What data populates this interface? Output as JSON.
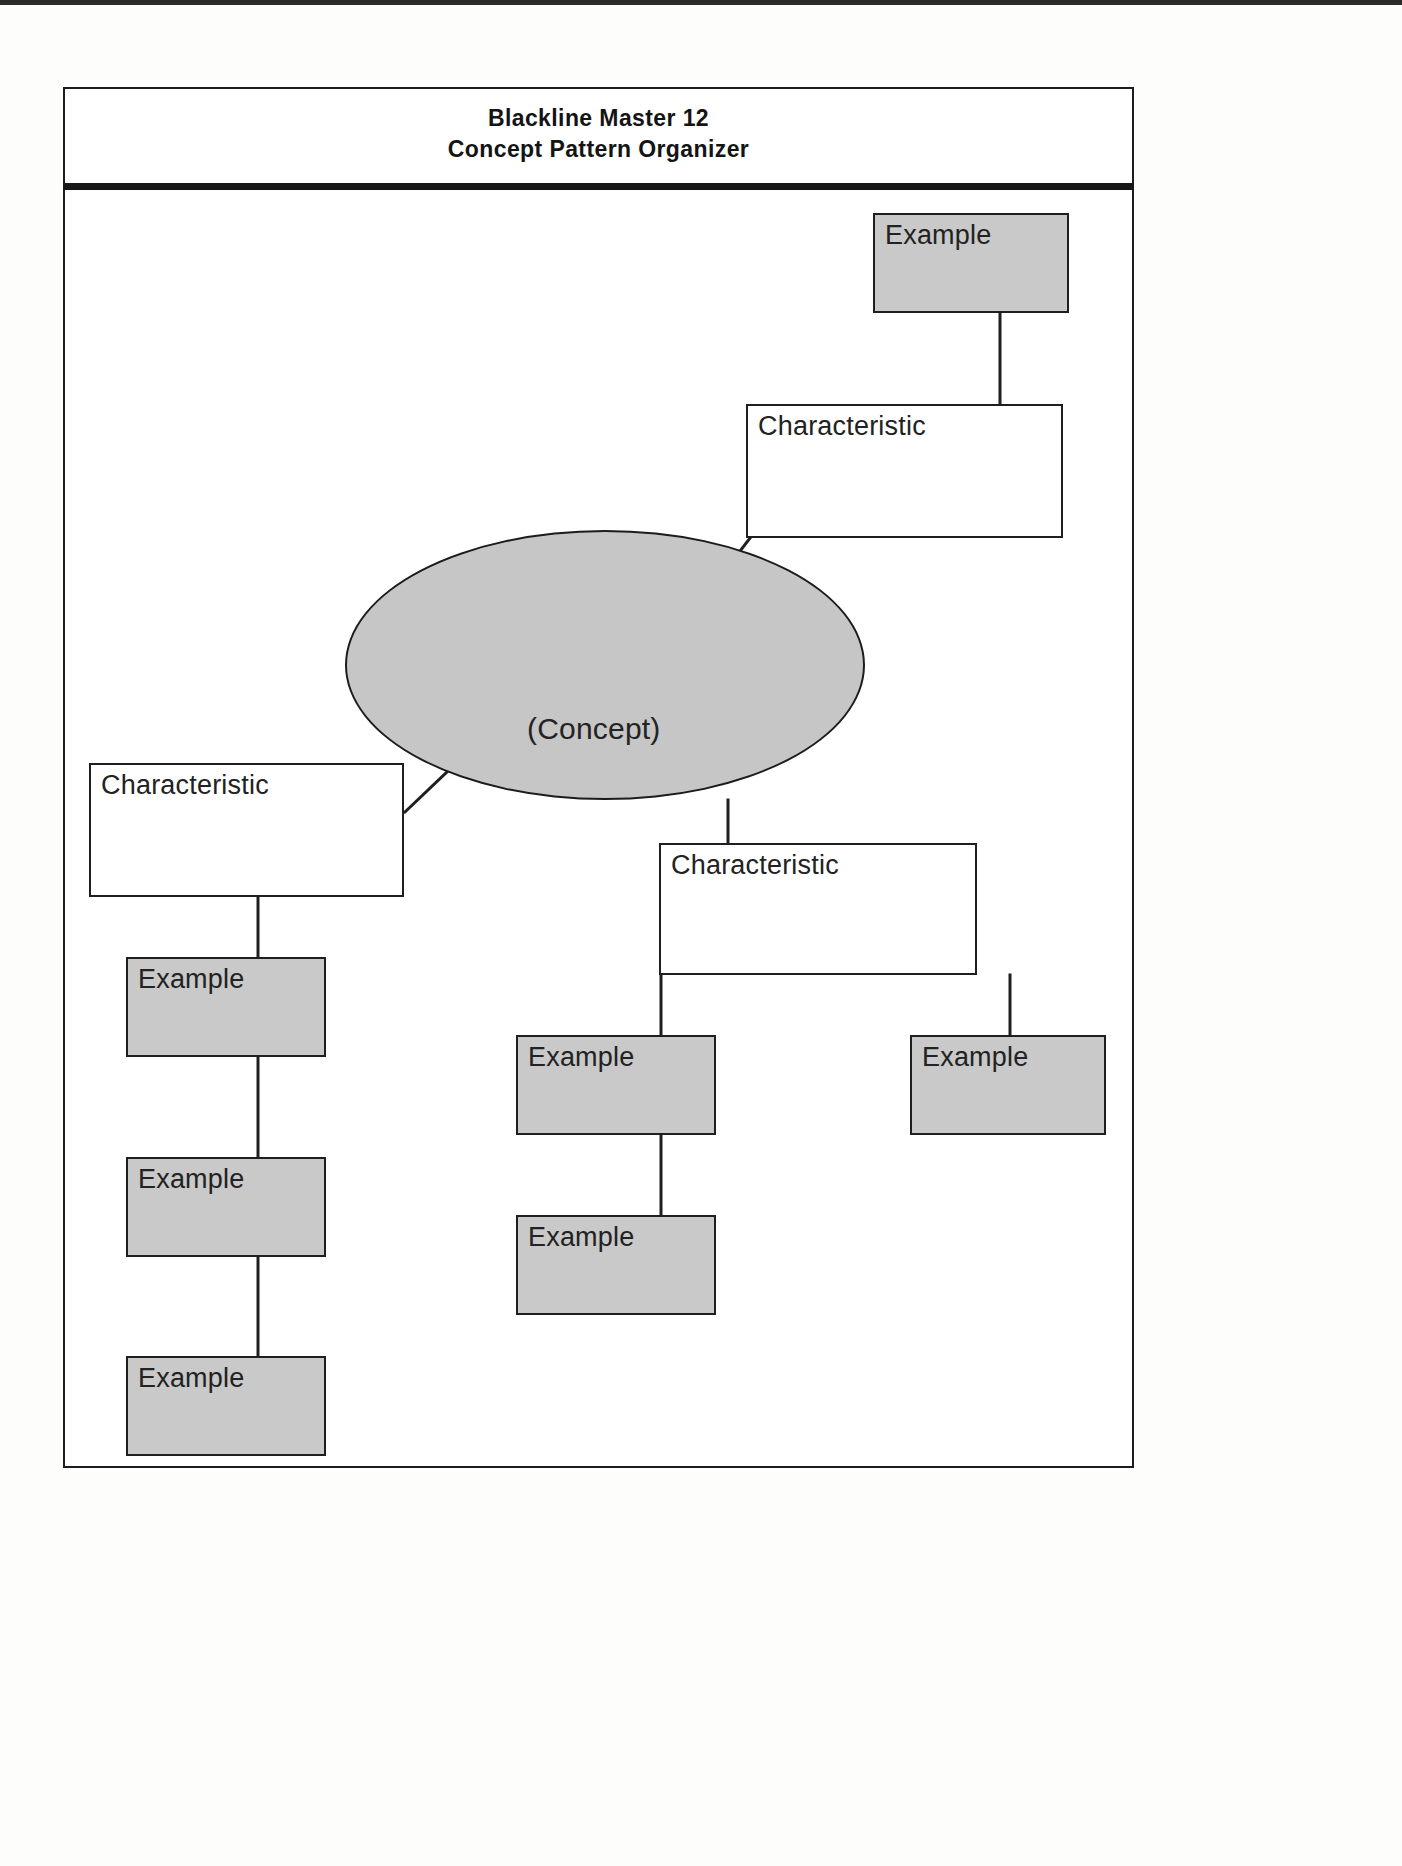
{
  "document": {
    "title_line_1": "Blackline Master 12",
    "title_line_2": "Concept Pattern Organizer"
  },
  "diagram": {
    "type": "concept-map",
    "center": {
      "label": "(Concept)",
      "shape": "ellipse",
      "fill": "#c6c6c6"
    },
    "colors": {
      "characteristic_fill": "#ffffff",
      "example_fill": "#c9c9c9",
      "stroke": "#1f1f1f",
      "rule": "#181818"
    },
    "nodes": [
      {
        "id": "example-top-right",
        "label": "Example",
        "kind": "example"
      },
      {
        "id": "characteristic-top-right",
        "label": "Characteristic",
        "kind": "characteristic"
      },
      {
        "id": "characteristic-left",
        "label": "Characteristic",
        "kind": "characteristic"
      },
      {
        "id": "example-left-1",
        "label": "Example",
        "kind": "example"
      },
      {
        "id": "example-left-2",
        "label": "Example",
        "kind": "example"
      },
      {
        "id": "example-left-3",
        "label": "Example",
        "kind": "example"
      },
      {
        "id": "characteristic-middle",
        "label": "Characteristic",
        "kind": "characteristic"
      },
      {
        "id": "example-middle-1",
        "label": "Example",
        "kind": "example"
      },
      {
        "id": "example-middle-2",
        "label": "Example",
        "kind": "example"
      },
      {
        "id": "example-right",
        "label": "Example",
        "kind": "example"
      }
    ],
    "edges": [
      {
        "from": "example-top-right",
        "to": "characteristic-top-right"
      },
      {
        "from": "characteristic-top-right",
        "to": "concept"
      },
      {
        "from": "concept",
        "to": "characteristic-left"
      },
      {
        "from": "characteristic-left",
        "to": "example-left-1"
      },
      {
        "from": "example-left-1",
        "to": "example-left-2"
      },
      {
        "from": "example-left-2",
        "to": "example-left-3"
      },
      {
        "from": "concept",
        "to": "characteristic-middle"
      },
      {
        "from": "characteristic-middle",
        "to": "example-middle-1"
      },
      {
        "from": "example-middle-1",
        "to": "example-middle-2"
      },
      {
        "from": "characteristic-middle",
        "to": "example-right"
      }
    ]
  }
}
